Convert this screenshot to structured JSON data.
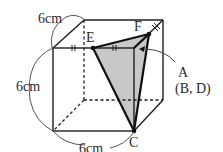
{
  "figure": {
    "type": "cube with shaded tetrahedron section",
    "dimensions": {
      "top_edge": "6cm",
      "left_edge": "6cm",
      "bottom_edge": "6cm"
    },
    "vertices": {
      "E": "E",
      "F": "F",
      "A": "A",
      "A_note": "(B, D)",
      "C": "C"
    },
    "colors": {
      "line": "#1e1e1e",
      "shade": "#c8c8c8",
      "dim": "#555555"
    }
  }
}
